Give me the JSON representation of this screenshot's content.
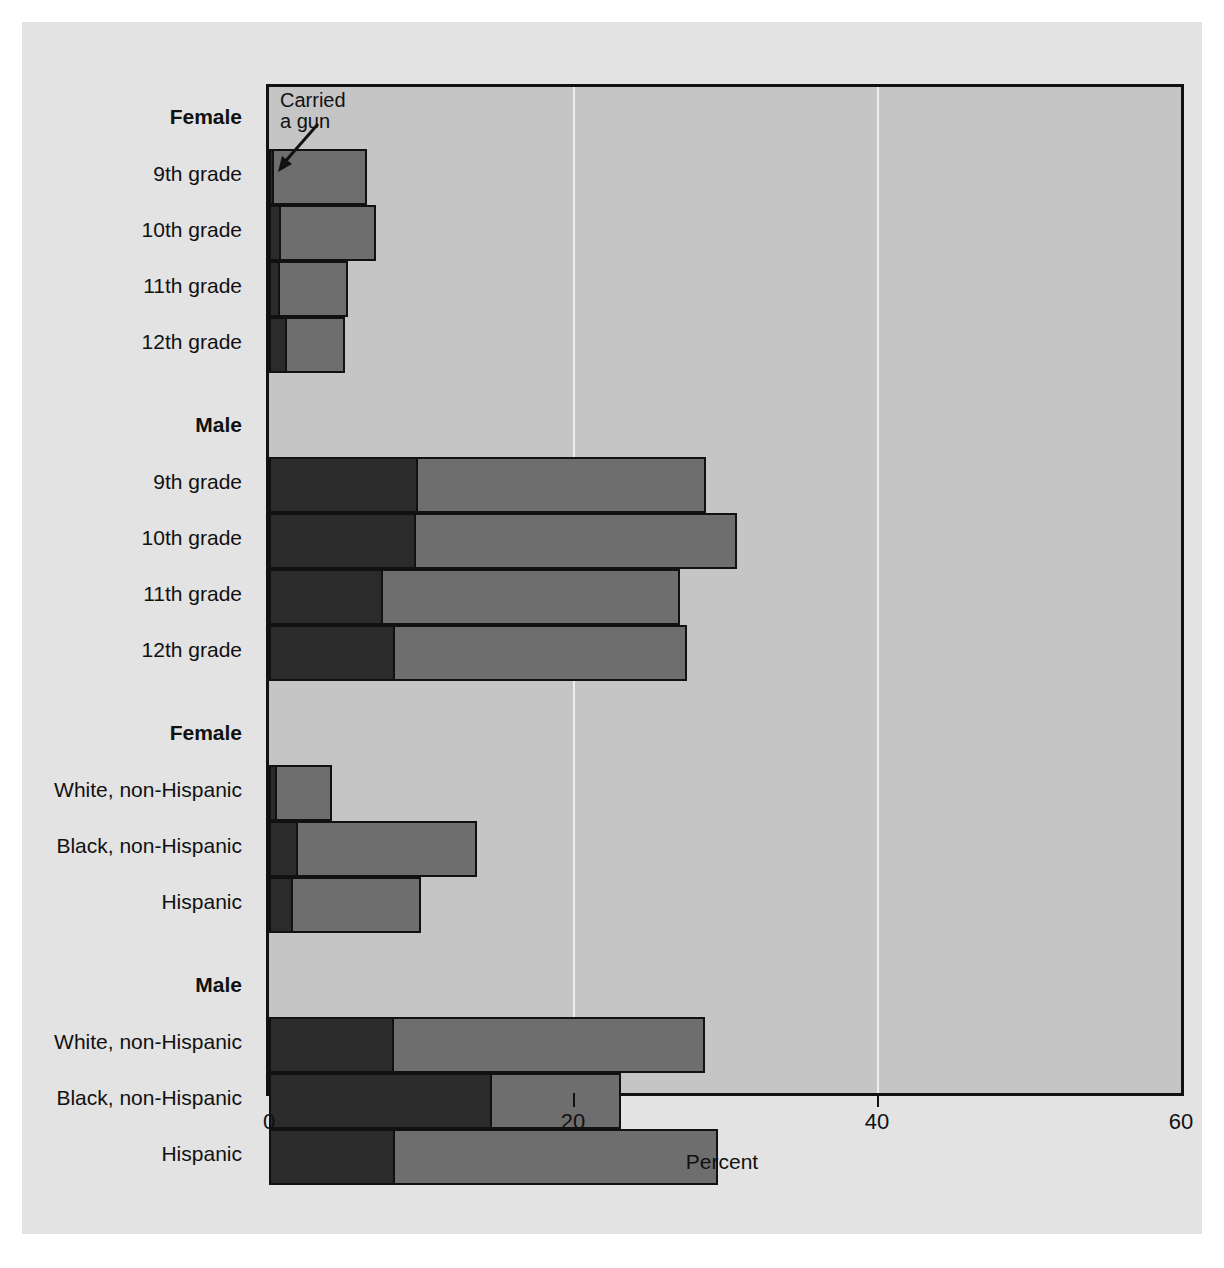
{
  "figure": {
    "title_fragment": "",
    "annotation": {
      "label": "Carried\na gun",
      "name": "carried-a-gun-annotation"
    }
  },
  "axis": {
    "x_title": "Percent",
    "ticks": [
      {
        "value": 0,
        "label": "0"
      },
      {
        "value": 20,
        "label": "20"
      },
      {
        "value": 40,
        "label": "40"
      },
      {
        "value": 60,
        "label": "60"
      }
    ],
    "gridlines": [
      20,
      40
    ]
  },
  "colors": {
    "carried_gun": "#2b2b2b",
    "carried_weapon": "#6e6e6e",
    "plot_background": "#c5c5c5",
    "paper_background": "#e3e3e3",
    "axis": "#111111",
    "gridline": "#efefef"
  },
  "groups": [
    {
      "heading": "Female",
      "rows": [
        {
          "label": "9th grade",
          "gun": 0.3,
          "total": 6.6
        },
        {
          "label": "10th grade",
          "gun": 0.8,
          "total": 7.2
        },
        {
          "label": "11th grade",
          "gun": 0.7,
          "total": 5.3
        },
        {
          "label": "12th grade",
          "gun": 1.2,
          "total": 5.1
        }
      ]
    },
    {
      "heading": "Male",
      "rows": [
        {
          "label": "9th grade",
          "gun": 9.8,
          "total": 28.9
        },
        {
          "label": "10th grade",
          "gun": 9.7,
          "total": 30.9
        },
        {
          "label": "11th grade",
          "gun": 7.5,
          "total": 27.2
        },
        {
          "label": "12th grade",
          "gun": 8.3,
          "total": 27.6
        }
      ]
    },
    {
      "heading": "Female",
      "rows": [
        {
          "label": "White, non-Hispanic",
          "gun": 0.5,
          "total": 4.3
        },
        {
          "label": "Black, non-Hispanic",
          "gun": 1.9,
          "total": 13.8
        },
        {
          "label": "Hispanic",
          "gun": 1.6,
          "total": 10.1
        }
      ]
    },
    {
      "heading": "Male",
      "rows": [
        {
          "label": "White, non-Hispanic",
          "gun": 8.2,
          "total": 28.8
        },
        {
          "label": "Black, non-Hispanic",
          "gun": 14.7,
          "total": 23.3
        },
        {
          "label": "Hispanic",
          "gun": 8.3,
          "total": 29.7
        }
      ]
    }
  ],
  "chart_data": {
    "type": "bar",
    "orientation": "horizontal",
    "stacked": true,
    "title": "",
    "xlabel": "Percent",
    "ylabel": "",
    "xlim": [
      0,
      60
    ],
    "xticks": [
      0,
      20,
      40,
      60
    ],
    "grid": "vertical gridlines at 20 and 40",
    "legend": "inline annotation: 'Carried a gun' points to the dark inner segment",
    "categories": [
      "Female 9th grade",
      "Female 10th grade",
      "Female 11th grade",
      "Female 12th grade",
      "Male 9th grade",
      "Male 10th grade",
      "Male 11th grade",
      "Male 12th grade",
      "Female White, non-Hispanic",
      "Female Black, non-Hispanic",
      "Female Hispanic",
      "Male White, non-Hispanic",
      "Male Black, non-Hispanic",
      "Male Hispanic"
    ],
    "series": [
      {
        "name": "Carried a gun",
        "color": "#2b2b2b",
        "values": [
          0.3,
          0.8,
          0.7,
          1.2,
          9.8,
          9.7,
          7.5,
          8.3,
          0.5,
          1.9,
          1.6,
          8.2,
          14.7,
          8.3
        ]
      },
      {
        "name": "Carried a weapon (total)",
        "color": "#6e6e6e",
        "values": [
          6.6,
          7.2,
          5.3,
          5.1,
          28.9,
          30.9,
          27.2,
          27.6,
          4.3,
          13.8,
          10.1,
          28.8,
          23.3,
          29.7
        ]
      }
    ]
  }
}
